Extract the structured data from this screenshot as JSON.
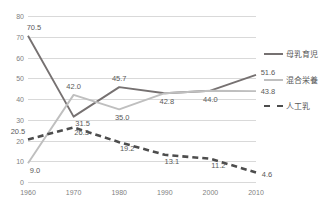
{
  "chart_data": {
    "type": "line",
    "title": "",
    "xlabel": "",
    "ylabel": "",
    "categories": [
      "1960",
      "1970",
      "1980",
      "1990",
      "2000",
      "2010"
    ],
    "x": [
      1960,
      1970,
      1980,
      1990,
      2000,
      2010
    ],
    "xlim": [
      1960,
      2010
    ],
    "ylim": [
      0,
      80
    ],
    "yticks": [
      "0",
      "10",
      "20",
      "30",
      "40",
      "50",
      "60",
      "70",
      "80"
    ],
    "ytick_values": [
      0,
      10,
      20,
      30,
      40,
      50,
      60,
      70,
      80
    ],
    "grid": true,
    "legend_position": "right",
    "series": [
      {
        "name": "母乳育児",
        "style": "solid",
        "color": "#767171",
        "values": [
          70.5,
          31.5,
          45.7,
          42.8,
          44.0,
          51.6
        ],
        "labels": [
          "70.5",
          "31.5",
          "45.7",
          "42.8",
          "44.0",
          "51.6"
        ]
      },
      {
        "name": "混合栄養",
        "style": "solid",
        "color": "#bfbfbf",
        "values": [
          9.0,
          42.0,
          35.0,
          42.8,
          44.0,
          43.8
        ],
        "labels": [
          "9.0",
          "42.0",
          "35.0",
          "",
          "",
          "43.8"
        ]
      },
      {
        "name": "人工乳",
        "style": "dashed",
        "color": "#4d4d4d",
        "values": [
          20.5,
          26.3,
          19.2,
          13.1,
          11.2,
          4.6
        ],
        "labels": [
          "20.5",
          "26.3",
          "19.2",
          "13.1",
          "11.2",
          "4.6"
        ]
      }
    ]
  },
  "legend": {
    "items": [
      {
        "label": "母乳育児"
      },
      {
        "label": "混合栄養"
      },
      {
        "label": "人工乳"
      }
    ]
  }
}
